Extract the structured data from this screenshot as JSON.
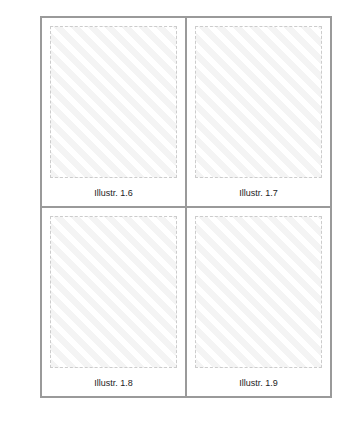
{
  "figures": [
    {
      "caption": "Illustr. 1.6"
    },
    {
      "caption": "Illustr. 1.7"
    },
    {
      "caption": "Illustr. 1.8"
    },
    {
      "caption": "Illustr. 1.9"
    }
  ]
}
